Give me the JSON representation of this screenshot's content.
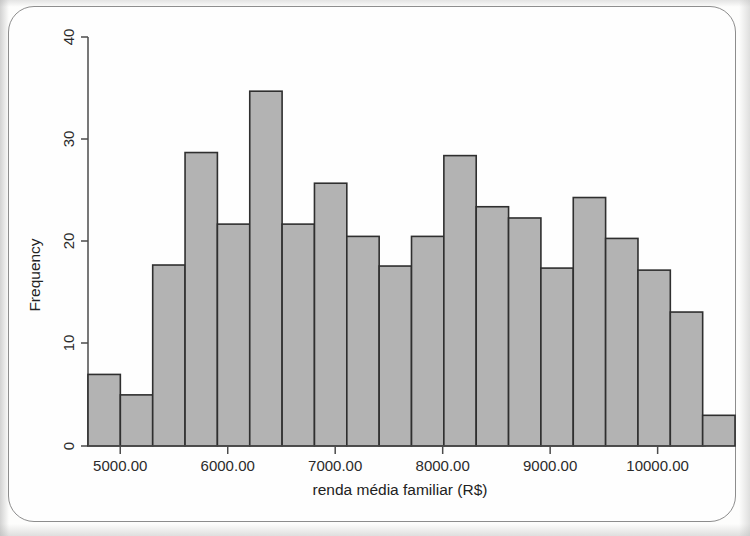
{
  "figure": {
    "kind": "histogram-figure",
    "background_color": "#fefefe",
    "frame_color": "#8d8d8d"
  },
  "chart_data": {
    "type": "bar",
    "title": "",
    "subtitle": "",
    "xlabel": "renda média familiar (R$)",
    "ylabel": "Frequency",
    "grid": false,
    "legend": null,
    "bar_fill_color": "#b3b3b3",
    "bar_stroke_color": "#2f2f2f",
    "xlim": [
      4700,
      10450
    ],
    "ylim": [
      0,
      41
    ],
    "xticks": [
      5000,
      6000,
      7000,
      8000,
      9000,
      10000
    ],
    "xtick_labels": [
      "5000.00",
      "6000.00",
      "7000.00",
      "8000.00",
      "9000.00",
      "10000.00"
    ],
    "yticks": [
      0,
      10,
      20,
      30,
      40
    ],
    "ytick_labels": [
      "0",
      "10",
      "20",
      "30",
      "40"
    ],
    "bin_width": 301,
    "bin_edges": [
      4700,
      5001,
      5302,
      5603,
      5904,
      6205,
      6506,
      6807,
      7108,
      7409,
      7710,
      8011,
      8312,
      8613,
      8914,
      9215,
      9516,
      9817,
      10118,
      10419,
      10720
    ],
    "categories": [
      "4700-5001",
      "5001-5302",
      "5302-5603",
      "5603-5904",
      "5904-6205",
      "6205-6506",
      "6506-6807",
      "6807-7108",
      "7108-7409",
      "7409-7710",
      "7710-8011",
      "8011-8312",
      "8312-8613",
      "8613-8914",
      "8914-9215",
      "9215-9516",
      "9516-9817",
      "9817-10118",
      "10118-10419",
      "10419-10720"
    ],
    "values": [
      7,
      5,
      17.7,
      28.7,
      21.7,
      34.7,
      21.7,
      25.7,
      20.5,
      17.6,
      20.5,
      28.4,
      23.4,
      22.3,
      17.4,
      24.3,
      20.3,
      17.2,
      13.1,
      3
    ]
  }
}
